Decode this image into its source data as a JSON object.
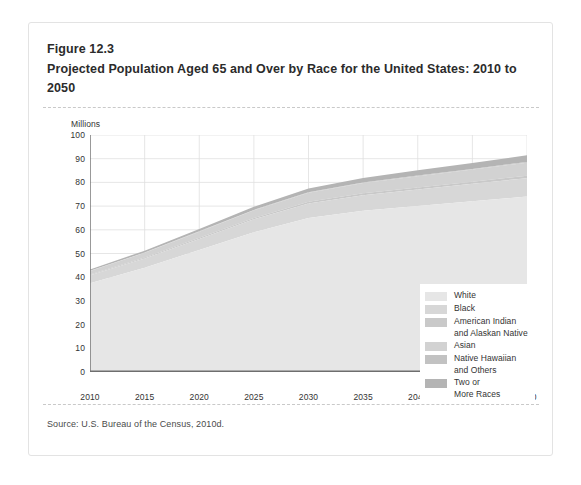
{
  "figure": {
    "label": "Figure 12.3",
    "title": "Projected Population Aged 65 and Over by Race for the United States: 2010 to 2050",
    "source": "Source: U.S. Bureau of the Census, 2010d."
  },
  "chart_data": {
    "type": "area",
    "stacked": true,
    "title": "Projected Population Aged 65 and Over by Race for the United States: 2010 to 2050",
    "xlabel": "",
    "ylabel": "Millions",
    "xlim": [
      2010,
      2050
    ],
    "ylim": [
      0,
      100
    ],
    "ytick_step": 10,
    "xtick_step": 5,
    "grid": true,
    "legend_position": "inside-right",
    "x": [
      2010,
      2015,
      2020,
      2025,
      2030,
      2035,
      2040,
      2045,
      2050
    ],
    "xticklabels": [
      "2010",
      "2015",
      "2020",
      "2025",
      "2030",
      "2035",
      "2040",
      "2045",
      "2050"
    ],
    "yticklabels": [
      "0",
      "10",
      "20",
      "30",
      "40",
      "50",
      "60",
      "70",
      "80",
      "90",
      "100"
    ],
    "series": [
      {
        "name": "White",
        "color": "#e6e6e6",
        "values": [
          37.5,
          44.0,
          51.5,
          59.0,
          65.0,
          68.0,
          70.0,
          72.0,
          74.0
        ]
      },
      {
        "name": "Black",
        "color": "#d7d7d7",
        "values": [
          3.3,
          3.9,
          4.6,
          5.4,
          6.1,
          6.6,
          7.0,
          7.4,
          7.8
        ]
      },
      {
        "name": "American Indian and Alaskan Native",
        "color": "#c9c9c9",
        "values": [
          0.3,
          0.4,
          0.5,
          0.6,
          0.7,
          0.8,
          0.9,
          0.9,
          1.0
        ]
      },
      {
        "name": "Asian",
        "color": "#d2d2d2",
        "values": [
          1.5,
          2.0,
          2.6,
          3.2,
          3.8,
          4.3,
          4.7,
          5.1,
          5.5
        ]
      },
      {
        "name": "Native Hawaiian and Others",
        "color": "#c2c2c2",
        "values": [
          0.1,
          0.1,
          0.15,
          0.2,
          0.2,
          0.25,
          0.3,
          0.3,
          0.35
        ]
      },
      {
        "name": "Two or More Races",
        "color": "#b4b4b4",
        "values": [
          0.6,
          0.8,
          1.0,
          1.3,
          1.6,
          1.9,
          2.2,
          2.5,
          2.8
        ]
      }
    ],
    "totals": [
      43.3,
      51.2,
      60.35,
      69.7,
      77.4,
      81.85,
      85.1,
      88.2,
      91.45
    ]
  },
  "legend": {
    "items": [
      {
        "label": "White",
        "label2": "",
        "color": "#e6e6e6"
      },
      {
        "label": "Black",
        "label2": "",
        "color": "#d7d7d7"
      },
      {
        "label": "American Indian",
        "label2": "and Alaskan Native",
        "color": "#c9c9c9"
      },
      {
        "label": "Asian",
        "label2": "",
        "color": "#d2d2d2"
      },
      {
        "label": "Native Hawaiian",
        "label2": "and Others",
        "color": "#c2c2c2"
      },
      {
        "label": "Two or",
        "label2": "More Races",
        "color": "#b4b4b4"
      }
    ]
  },
  "axes": {
    "unit_label": "Millions"
  }
}
